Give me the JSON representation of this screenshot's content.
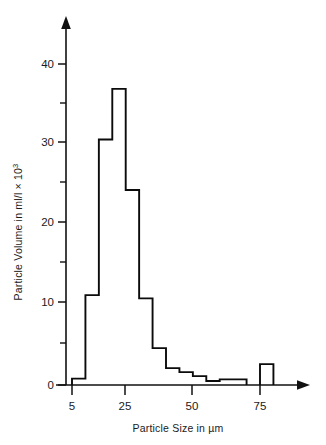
{
  "chart_data": {
    "type": "bar",
    "title": "",
    "subtitle": "",
    "xlabel": "Particle Size in µm",
    "ylabel": "Particle Volume in ml/l × 10³",
    "ylabel_main": "Particle Volume in ml/l × 10",
    "ylabel_exponent": "3",
    "xlim": [
      0,
      85
    ],
    "ylim": [
      0,
      42
    ],
    "grid": false,
    "legend": false,
    "bin_width": 5,
    "categories": [
      "5-10",
      "10-15",
      "15-20",
      "20-25",
      "25-30",
      "30-35",
      "35-40",
      "40-45",
      "45-50",
      "50-55",
      "55-60",
      "60-65",
      "65-70",
      "70-75",
      "75-80"
    ],
    "bin_starts": [
      5,
      10,
      15,
      20,
      25,
      30,
      35,
      40,
      45,
      50,
      55,
      60,
      65,
      70,
      75
    ],
    "values": [
      0.8,
      11.2,
      30.6,
      36.9,
      24.3,
      10.8,
      4.6,
      2.1,
      1.6,
      1.1,
      0.5,
      0.7,
      0.7,
      0,
      2.6
    ],
    "x_ticks_major": [
      5,
      25,
      50,
      75
    ],
    "x_tick_labels": [
      "5",
      "25",
      "50",
      "75"
    ],
    "x_ticks_minor": [
      10,
      15,
      20,
      30,
      35,
      40,
      45,
      55,
      60,
      65,
      70,
      80
    ],
    "y_ticks_major": [
      0,
      10,
      20,
      30,
      40
    ],
    "y_tick_labels": [
      "0",
      "10",
      "20",
      "30",
      "40"
    ],
    "y_ticks_minor": [
      5,
      15,
      25,
      35
    ],
    "line_color": "#0b0b0b",
    "background_color": "#ffffff"
  },
  "figure": {
    "axis_color": "#111111",
    "text_color": "#1a1a1a"
  }
}
